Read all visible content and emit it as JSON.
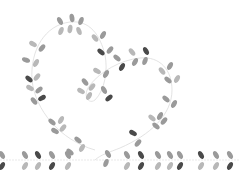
{
  "image": {
    "description": "Decorative vine of leaves forming a heart shape with a curl, over a horizontal leafy vine border",
    "width": 239,
    "height": 176,
    "colors": {
      "background": "#ffffff",
      "stem": "#d9d9d9",
      "leaf_light": "#b8b8b8",
      "leaf_mid": "#9a9a9a",
      "leaf_dark": "#4a4a4a"
    }
  }
}
